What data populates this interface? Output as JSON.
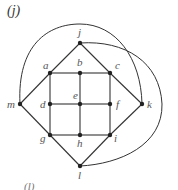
{
  "figure": {
    "label": "(j)",
    "bottom_partial_label": "(l)",
    "line_color": "#333333",
    "node_color": "#222222"
  },
  "nodes": [
    {
      "id": "j",
      "x": 80,
      "y": 43,
      "lx": 78,
      "ly": 36
    },
    {
      "id": "a",
      "x": 50,
      "y": 73,
      "lx": 43,
      "ly": 69
    },
    {
      "id": "b",
      "x": 80,
      "y": 73,
      "lx": 77,
      "ly": 66
    },
    {
      "id": "c",
      "x": 110,
      "y": 73,
      "lx": 115,
      "ly": 69
    },
    {
      "id": "m",
      "x": 20,
      "y": 104,
      "lx": 7,
      "ly": 108
    },
    {
      "id": "d",
      "x": 50,
      "y": 104,
      "lx": 40,
      "ly": 108
    },
    {
      "id": "e",
      "x": 80,
      "y": 104,
      "lx": 73,
      "ly": 99
    },
    {
      "id": "f",
      "x": 110,
      "y": 104,
      "lx": 116,
      "ly": 108
    },
    {
      "id": "k",
      "x": 142,
      "y": 104,
      "lx": 147,
      "ly": 108
    },
    {
      "id": "g",
      "x": 50,
      "y": 135,
      "lx": 40,
      "ly": 142
    },
    {
      "id": "h",
      "x": 80,
      "y": 135,
      "lx": 77,
      "ly": 147
    },
    {
      "id": "i",
      "x": 110,
      "y": 135,
      "lx": 114,
      "ly": 142
    },
    {
      "id": "l",
      "x": 80,
      "y": 166,
      "lx": 78,
      "ly": 179
    }
  ],
  "edges": [
    [
      "j",
      "a"
    ],
    [
      "j",
      "c"
    ],
    [
      "a",
      "b"
    ],
    [
      "b",
      "c"
    ],
    [
      "a",
      "d"
    ],
    [
      "b",
      "e"
    ],
    [
      "c",
      "f"
    ],
    [
      "d",
      "e"
    ],
    [
      "e",
      "f"
    ],
    [
      "d",
      "g"
    ],
    [
      "e",
      "h"
    ],
    [
      "f",
      "i"
    ],
    [
      "g",
      "h"
    ],
    [
      "h",
      "i"
    ],
    [
      "a",
      "m"
    ],
    [
      "m",
      "g"
    ],
    [
      "g",
      "l"
    ],
    [
      "l",
      "i"
    ],
    [
      "c",
      "k"
    ],
    [
      "i",
      "k"
    ]
  ],
  "curved_edges": [
    {
      "from": "m",
      "to": "k",
      "path": "M20,104 C18,40 50,24 80,24 C118,24 144,60 142,104"
    },
    {
      "from": "j",
      "to": "k",
      "path": "M80,43 C130,38 168,60 166,104 C166,150 120,168 80,166"
    },
    {
      "from": "l",
      "to": "k",
      "path": "M142,104 L142,104"
    }
  ]
}
